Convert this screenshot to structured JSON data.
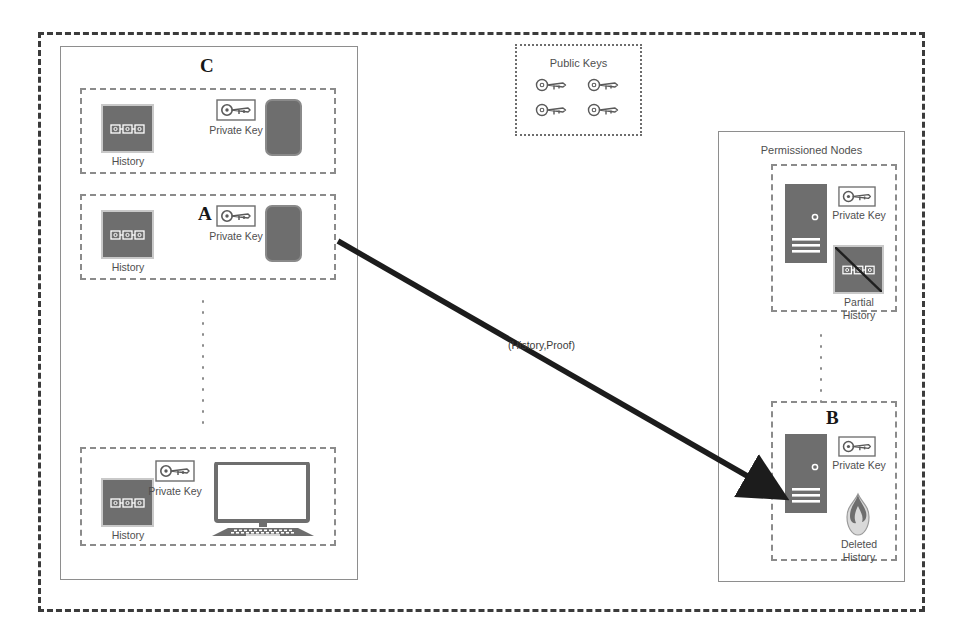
{
  "diagram": {
    "colors": {
      "icon_fill": "#6e6e6e",
      "border_gray": "#8e8e8e",
      "dash_dark": "#3b3b3b",
      "text": "#4f4f4f",
      "arrow": "#1c1c1c"
    },
    "client_region": {
      "name": "client-devices-region",
      "groups": [
        {
          "id": "group-c",
          "letter": "C",
          "device": "smartphone",
          "history_label": "History",
          "key_label": "Private Key"
        },
        {
          "id": "group-a",
          "letter": "A",
          "device": "smartphone",
          "history_label": "History",
          "key_label": "Private Key"
        },
        {
          "id": "group-last",
          "letter": "",
          "device": "desktop-computer",
          "history_label": "History",
          "key_label": "Private Key"
        }
      ],
      "ellipsis": "vertical-dots"
    },
    "public_keys": {
      "title": "Public Keys",
      "count": 4,
      "keys": [
        "public-key-1",
        "public-key-2",
        "public-key-3",
        "public-key-4"
      ]
    },
    "permissioned_region": {
      "title": "Permissioned Nodes",
      "nodes": [
        {
          "id": "node-top",
          "letter": "",
          "device": "server",
          "key_label": "Private Key",
          "history_label": "Partial\nHistory",
          "history_state": "partial"
        },
        {
          "id": "node-b",
          "letter": "B",
          "device": "server",
          "key_label": "Private Key",
          "history_label": "Deleted\nHistory",
          "history_state": "deleted"
        }
      ],
      "ellipsis": "vertical-dots"
    },
    "edge": {
      "label": "(History,Proof)",
      "from": "group-a",
      "to": "node-b",
      "style": "solid-arrow"
    }
  }
}
